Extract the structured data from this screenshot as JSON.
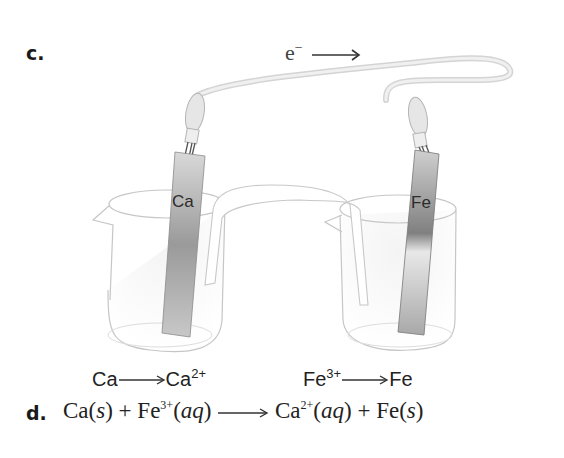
{
  "part_c": {
    "label": "c."
  },
  "electron_flow": {
    "symbol": "e",
    "charge": "−",
    "direction": "right"
  },
  "electrodes": {
    "anode": {
      "label": "Ca"
    },
    "cathode": {
      "label": "Fe"
    }
  },
  "half_reactions": {
    "left": {
      "reactant": "Ca",
      "product": "Ca",
      "product_charge": "2+"
    },
    "right": {
      "reactant": "Fe",
      "reactant_charge": "3+",
      "product": "Fe"
    }
  },
  "part_d": {
    "label": "d.",
    "equation": {
      "r1": "Ca",
      "r1_state": "s",
      "plus1": "+",
      "r2": "Fe",
      "r2_charge": "3+",
      "r2_state": "aq",
      "p1": "Ca",
      "p1_charge": "2+",
      "p1_state": "aq",
      "plus2": "+",
      "p2": "Fe",
      "p2_state": "s"
    }
  },
  "colors": {
    "wire": "#e2e2e2",
    "outline": "#bdbdbd",
    "text": "#222222"
  }
}
